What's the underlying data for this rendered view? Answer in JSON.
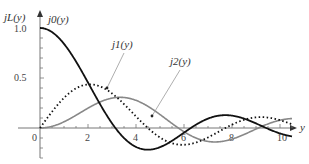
{
  "chart_data": {
    "type": "line",
    "title": "",
    "xlabel": "y",
    "ylabel": "j_L(y)",
    "xlim": [
      0,
      10.5
    ],
    "ylim": [
      -0.3,
      1.1
    ],
    "x_ticks": [
      "0",
      "2",
      "4",
      "6",
      "8",
      "10"
    ],
    "y_ticks": [
      "0.5",
      "1.0"
    ],
    "grid": false,
    "legend": "inline annotations",
    "series": [
      {
        "name": "j0(y)",
        "style": "solid black thick",
        "label": "j₀(y)"
      },
      {
        "name": "j1(y)",
        "style": "dotted black",
        "label": "j₁(y)"
      },
      {
        "name": "j2(y)",
        "style": "solid gray",
        "label": "j₂(y)"
      }
    ],
    "sample_points": {
      "x": [
        0,
        1,
        2,
        3,
        4,
        5,
        6,
        7,
        8,
        9,
        10
      ],
      "j0": [
        1.0,
        0.841,
        0.455,
        0.047,
        -0.189,
        -0.192,
        -0.047,
        0.094,
        0.124,
        0.046,
        -0.054
      ],
      "j1": [
        0.0,
        0.301,
        0.435,
        0.346,
        0.116,
        -0.095,
        -0.167,
        -0.077,
        0.057,
        0.111,
        0.078
      ],
      "j2": [
        0.0,
        0.062,
        0.198,
        0.299,
        0.276,
        0.135,
        -0.037,
        -0.133,
        -0.1,
        0.027,
        0.108
      ]
    }
  },
  "labels": {
    "y_axis": "jL(y)",
    "x_axis": "y",
    "j0": "j0(y)",
    "j1": "j1(y)",
    "j2": "j2(y)"
  }
}
